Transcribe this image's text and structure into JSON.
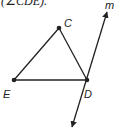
{
  "caption": "(∠CDE).",
  "diagram": {
    "type": "geometry",
    "points": [
      {
        "name": "C",
        "label": "C",
        "x": 59,
        "y": 28
      },
      {
        "name": "E",
        "label": "E",
        "x": 14,
        "y": 80
      },
      {
        "name": "D",
        "label": "D",
        "x": 87,
        "y": 80
      }
    ],
    "segments": [
      [
        "E",
        "C"
      ],
      [
        "C",
        "D"
      ],
      [
        "E",
        "D"
      ]
    ],
    "line": {
      "label": "m",
      "through": "D",
      "arrows": "both"
    },
    "colors": {
      "stroke": "#222222"
    }
  }
}
